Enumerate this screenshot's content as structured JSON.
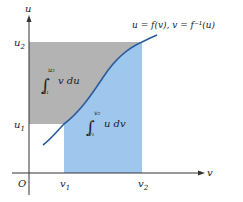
{
  "figure": {
    "axes": {
      "x_label": "v",
      "y_label": "u",
      "origin_label": "O"
    },
    "ticks": {
      "u1": {
        "base": "u",
        "sub": "1"
      },
      "u2": {
        "base": "u",
        "sub": "2"
      },
      "v1": {
        "base": "v",
        "sub": "1"
      },
      "v2": {
        "base": "v",
        "sub": "2"
      }
    },
    "curve_label": "u = f(v),  v = f⁻¹(u)",
    "regions": {
      "gray": {
        "integral": {
          "lower": "u₁",
          "upper": "u₂",
          "integrand": "v du"
        },
        "color": "#b3b3b3"
      },
      "blue": {
        "integral": {
          "lower": "v₁",
          "upper": "v₂",
          "integrand": "u dv"
        },
        "color": "#9fc7ee"
      }
    },
    "curve_color": "#2a5d9a",
    "axis_color": "#333333"
  }
}
